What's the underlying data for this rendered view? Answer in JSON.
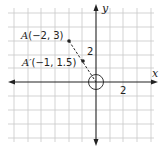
{
  "diagram": {
    "type": "coordinate-plane",
    "axes": {
      "x_label": "x",
      "y_label": "y",
      "x_tick_label": "2",
      "y_tick_label": "2"
    },
    "points": [
      {
        "name": "A",
        "label_prefix": "A",
        "label_coords": "(−2, 3)",
        "x": -2,
        "y": 3
      },
      {
        "name": "A'",
        "label_prefix": "A′",
        "label_coords": "(−1, 1.5)",
        "x": -1,
        "y": 1.5
      }
    ],
    "dilation_center": {
      "x": 0,
      "y": 0,
      "marker": "circle"
    },
    "segment": {
      "from": "A",
      "to": "origin",
      "style": "dashed"
    },
    "colors": {
      "grid": "#c8c8c8",
      "axis": "#222222",
      "point": "#222222"
    }
  }
}
